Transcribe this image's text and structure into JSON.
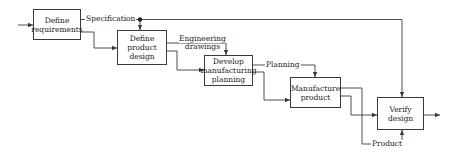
{
  "diagram": {
    "type": "flowchart",
    "nodes": [
      {
        "id": "define_requirements",
        "label_line1": "Define",
        "label_line2": "requirements"
      },
      {
        "id": "define_product_design",
        "label_line1": "Define product",
        "label_line2": "design"
      },
      {
        "id": "develop_manufacturing_planning",
        "label_line1": "Develop",
        "label_line2": "manufacturing",
        "label_line3": "planning"
      },
      {
        "id": "manufacture_product",
        "label_line1": "Manufacture",
        "label_line2": "product"
      },
      {
        "id": "verify_design",
        "label_line1": "Verify",
        "label_line2": "design"
      }
    ],
    "edge_labels": {
      "specification": "Specification",
      "engineering_line1": "Engineering",
      "engineering_line2": "drawings",
      "planning": "Planning",
      "product": "Product"
    },
    "edges": [
      {
        "from": "input",
        "to": "define_requirements"
      },
      {
        "from": "define_requirements",
        "to": "define_product_design",
        "label": "Specification"
      },
      {
        "from": "define_requirements",
        "to": "verify_design",
        "label": "Specification"
      },
      {
        "from": "define_requirements",
        "to": "define_product_design"
      },
      {
        "from": "define_product_design",
        "to": "develop_manufacturing_planning",
        "label": "Engineering drawings"
      },
      {
        "from": "define_product_design",
        "to": "develop_manufacturing_planning"
      },
      {
        "from": "develop_manufacturing_planning",
        "to": "manufacture_product",
        "label": "Planning"
      },
      {
        "from": "develop_manufacturing_planning",
        "to": "manufacture_product"
      },
      {
        "from": "manufacture_product",
        "to": "verify_design",
        "label": "Product"
      },
      {
        "from": "manufacture_product",
        "to": "verify_design"
      },
      {
        "from": "verify_design",
        "to": "output"
      }
    ],
    "colors": {
      "line": "#3a3a3a",
      "background": "#ffffff",
      "text": "#222222"
    }
  }
}
